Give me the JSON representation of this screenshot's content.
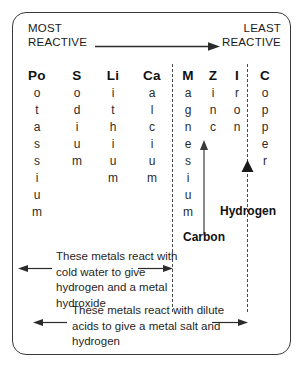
{
  "diagram": {
    "most_reactive_label": "MOST\nREACTIVE",
    "least_reactive_label": "LEAST\nREACTIVE",
    "colors": {
      "border": "#3a3a3a",
      "text": "#1a1a1a",
      "dashed_line": "#4a4a4a",
      "arrow": "#2b2b2b",
      "background": "#ffffff"
    }
  },
  "elements": [
    {
      "symbol": "Po",
      "name": "Potassium",
      "letters": [
        "o",
        "t",
        "a",
        "s",
        "s",
        "i",
        "u",
        "m"
      ],
      "x": 24
    },
    {
      "symbol": "S",
      "name": "Sodium",
      "letters": [
        "o",
        "d",
        "i",
        "u",
        "m"
      ],
      "x": 64
    },
    {
      "symbol": "Li",
      "name": "Lithium",
      "letters": [
        "i",
        "t",
        "h",
        "i",
        "u",
        "m"
      ],
      "x": 100
    },
    {
      "symbol": "Ca",
      "name": "Calcium",
      "letters": [
        "a",
        "l",
        "c",
        "i",
        "u",
        "m"
      ],
      "x": 139
    },
    {
      "symbol": "M",
      "name": "Magnesium",
      "letters": [
        "a",
        "g",
        "n",
        "e",
        "s",
        "i",
        "u",
        "m"
      ],
      "x": 175
    },
    {
      "symbol": "Z",
      "name": "Zinc",
      "letters": [
        "i",
        "n",
        "c"
      ],
      "x": 200
    },
    {
      "symbol": "I",
      "name": "Iron",
      "letters": [
        "r",
        "o",
        "n"
      ],
      "x": 224
    },
    {
      "symbol": "C",
      "name": "Copper",
      "letters": [
        "o",
        "p",
        "p",
        "e",
        "r"
      ],
      "x": 252
    }
  ],
  "markers": {
    "carbon_label": "Carbon",
    "hydrogen_label": "Hydrogen"
  },
  "notes": [
    {
      "id": "cold-water",
      "text": "These metals react with cold water to give hydrogen and a metal hydroxide"
    },
    {
      "id": "dilute-acids",
      "text": "These metals react with dilute acids to give a metal salt and hydrogen"
    }
  ],
  "chart_data": {
    "type": "table",
    "xlabel": "Decreasing reactivity →",
    "categories": [
      "Potassium",
      "Sodium",
      "Lithium",
      "Calcium",
      "Magnesium",
      "Zinc",
      "Iron",
      "Copper"
    ],
    "symbols": [
      "Po",
      "S",
      "Li",
      "Ca",
      "M",
      "Z",
      "I",
      "C"
    ],
    "values": [
      8,
      7,
      6,
      5,
      4,
      3,
      2,
      1
    ],
    "annotations": [
      {
        "label": "Carbon",
        "position_after": "Magnesium"
      },
      {
        "label": "Hydrogen",
        "position_after": "Iron"
      },
      {
        "label": "MOST REACTIVE",
        "position": "left"
      },
      {
        "label": "LEAST REACTIVE",
        "position": "right"
      }
    ],
    "grid": false,
    "legend": "none"
  }
}
